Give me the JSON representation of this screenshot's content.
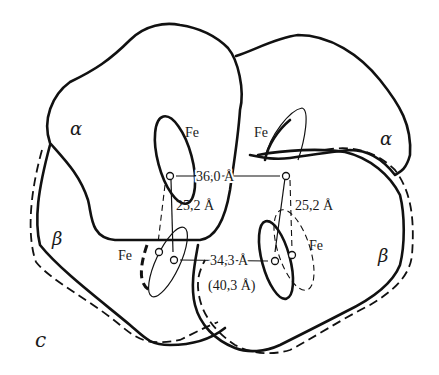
{
  "figure": {
    "panel_label": "c",
    "subunits": [
      {
        "id": "alpha-left",
        "label": "α"
      },
      {
        "id": "alpha-right",
        "label": "α"
      },
      {
        "id": "beta-left",
        "label": "β"
      },
      {
        "id": "beta-right",
        "label": "β"
      }
    ],
    "atoms": {
      "fe_top_left": "Fe",
      "fe_top_right": "Fe",
      "fe_bottom_left": "Fe",
      "fe_bottom_right": "Fe"
    },
    "distances": {
      "top_horizontal": "36,0 Å",
      "left_vertical": "25,2 Å",
      "right_vertical": "25,2 Å",
      "bottom_horizontal": "34,3 Å",
      "bottom_horizontal_alt": "(40,3 Å)"
    }
  }
}
